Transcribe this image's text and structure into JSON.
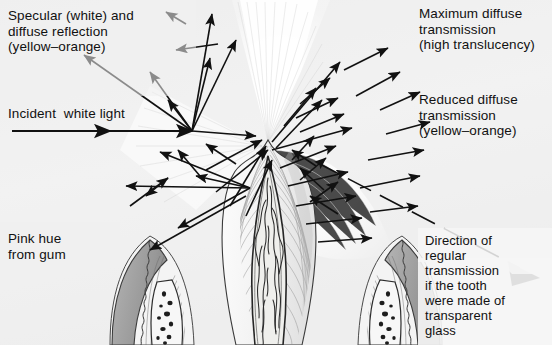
{
  "figure": {
    "background_color": "#f1f1f1",
    "ink_color": "#111111"
  },
  "labels": {
    "specular": {
      "text": "Specular (white) and\ndiffuse reflection\n(yellow–orange)",
      "x": 8,
      "y": 8
    },
    "incident": {
      "text": "Incident  white light",
      "x": 8,
      "y": 106
    },
    "pink_hue": {
      "text": "Pink hue\nfrom gum",
      "x": 8,
      "y": 231
    },
    "max_diffuse": {
      "text": "Maximum diffuse\ntransmission\n(high translucency)",
      "x": 419,
      "y": 6
    },
    "reduced_diffuse": {
      "text": "Reduced diffuse\ntransmission\n(yellow–orange)",
      "x": 419,
      "y": 92
    },
    "regular_transmission": {
      "text": "Direction of\nregular\ntransmission\nif the tooth\nwere made of\ntransparent\nglass",
      "x": 425,
      "y": 233
    }
  },
  "annotations": {
    "incident_ray_arrow": "horizontal arrow pointing right into tooth surface",
    "specular_arrow": "arrow pointing up-left toward specular reflection label",
    "regular_transmission_arrow": "dashed line to solid arrowhead pointing down-right",
    "diffuse_fan_top": "white fan of maximum diffuse transmission above incisal edge",
    "diffuse_fan_right": "reduced diffuse transmission fan to the right of tooth"
  },
  "anatomy": {
    "tooth_label": "incisor",
    "pulp_label": "pulp chamber with blood vessels",
    "gum_left_label": "gingiva and alveolar bone (left)",
    "gum_right_label": "gingiva and alveolar bone (right)"
  },
  "colors": {
    "background": "#f1f1f1",
    "enamel": "#f7f7f7",
    "dentin": "#ededed",
    "pulp": "#e8e8e6",
    "gum": "#9a9a9a",
    "bone": "#f0f0f0",
    "ink": "#111111"
  }
}
